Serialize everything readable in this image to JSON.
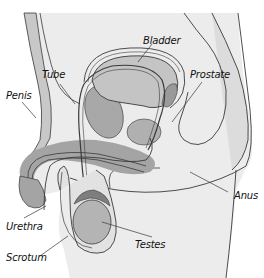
{
  "diagram": {
    "labels": {
      "bladder": "Bladder",
      "tube": "Tube",
      "prostate": "Prostate",
      "penis": "Penis",
      "anus": "Anus",
      "urethra": "Urethra",
      "testes": "Testes",
      "scrotum": "Scrotum"
    },
    "colors": {
      "background": "#ffffff",
      "body_light": "#ececec",
      "body_mid": "#d6d6d6",
      "organ": "#b4b4b4",
      "organ_dark": "#9a9a9a",
      "outline": "#3a3a3a"
    }
  }
}
